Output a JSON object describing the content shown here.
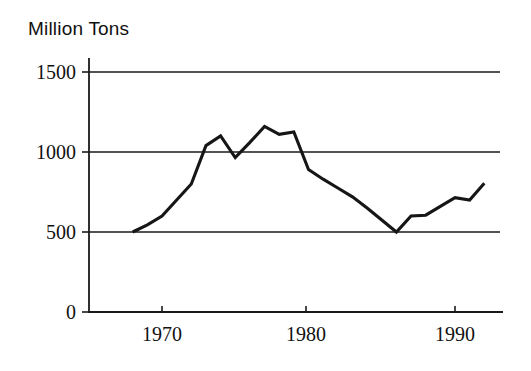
{
  "chart_data": {
    "type": "line",
    "title": "Million Tons",
    "xlabel": "",
    "ylabel": "Million Tons",
    "grid": true,
    "legend": null,
    "xlim": [
      1967.2,
      1992.8
    ],
    "ylim": [
      0,
      1600
    ],
    "y_ticks": [
      0,
      500,
      1000,
      1500
    ],
    "y_tick_labels": [
      "0",
      "500",
      "1000",
      "1500"
    ],
    "x_ticks": [
      1970,
      1980,
      1990
    ],
    "x_tick_labels": [
      "1970",
      "1980",
      "1990"
    ],
    "gridline_values": [
      500,
      1000,
      1500
    ],
    "series": [
      {
        "name": "Production",
        "x": [
          1968,
          1969,
          1970,
          1971,
          1972,
          1973,
          1974,
          1975,
          1976,
          1977,
          1978,
          1979,
          1980,
          1981,
          1982,
          1983,
          1984,
          1985,
          1986,
          1987,
          1988,
          1989,
          1990,
          1991,
          1992
        ],
        "values": [
          500,
          545,
          600,
          700,
          800,
          1040,
          1100,
          965,
          1060,
          1160,
          1110,
          1125,
          890,
          830,
          775,
          720,
          650,
          575,
          500,
          600,
          605,
          660,
          715,
          700,
          805
        ]
      }
    ]
  },
  "title": {
    "text": "Million Tons"
  },
  "axes": {
    "y_title": "Million Tons"
  }
}
